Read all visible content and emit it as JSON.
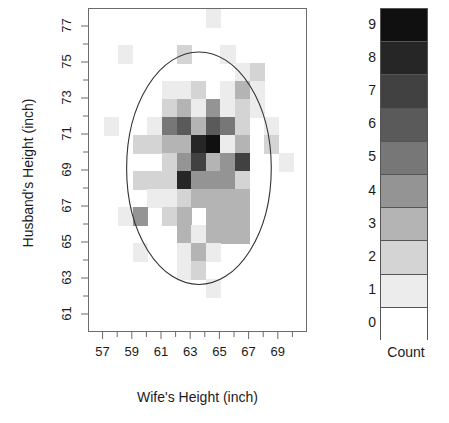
{
  "chart_data": {
    "type": "heatmap",
    "title": "",
    "xlabel": "Wife's Height (inch)",
    "ylabel": "Husband's Height (inch)",
    "xlim": [
      56,
      71
    ],
    "ylim": [
      60,
      78
    ],
    "grid": false,
    "legend_position": "right",
    "legend_title": "Count",
    "legend_ticks": [
      "9",
      "8",
      "7",
      "6",
      "5",
      "4",
      "3",
      "2",
      "1",
      "0"
    ],
    "colorscale": {
      "0": "#ffffff",
      "1": "#ececec",
      "2": "#d4d4d4",
      "3": "#b4b4b4",
      "4": "#949494",
      "5": "#777777",
      "6": "#5a5a5a",
      "7": "#414141",
      "8": "#262626",
      "9": "#101010"
    },
    "xtick_labels": [
      "57",
      "59",
      "61",
      "63",
      "65",
      "67",
      "69"
    ],
    "xtick_values": [
      57,
      59,
      61,
      63,
      65,
      67,
      69
    ],
    "ytick_labels": [
      "61",
      "63",
      "65",
      "67",
      "69",
      "71",
      "73",
      "75",
      "77"
    ],
    "ytick_values": [
      61,
      63,
      65,
      67,
      69,
      71,
      73,
      75,
      77
    ],
    "x_minor_step": 1,
    "y_minor_step": 1,
    "cell_width_inch": 1,
    "cell_height_inch": 1,
    "ellipse": {
      "center_x": 63.6,
      "center_y": 69.1,
      "radius_x": 5.0,
      "radius_y": 6.5,
      "stroke": "#333333"
    },
    "cells": [
      {
        "x": 64,
        "y": 77,
        "count": 1
      },
      {
        "x": 58,
        "y": 75,
        "count": 1
      },
      {
        "x": 62,
        "y": 75,
        "count": 2
      },
      {
        "x": 65,
        "y": 75,
        "count": 1
      },
      {
        "x": 66,
        "y": 74,
        "count": 1
      },
      {
        "x": 67,
        "y": 74,
        "count": 2
      },
      {
        "x": 61,
        "y": 73,
        "count": 1
      },
      {
        "x": 62,
        "y": 73,
        "count": 1
      },
      {
        "x": 63,
        "y": 73,
        "count": 2
      },
      {
        "x": 65,
        "y": 73,
        "count": 1
      },
      {
        "x": 66,
        "y": 73,
        "count": 3
      },
      {
        "x": 67,
        "y": 73,
        "count": 1
      },
      {
        "x": 61,
        "y": 72,
        "count": 2
      },
      {
        "x": 62,
        "y": 72,
        "count": 3
      },
      {
        "x": 63,
        "y": 72,
        "count": 1
      },
      {
        "x": 64,
        "y": 72,
        "count": 4
      },
      {
        "x": 65,
        "y": 72,
        "count": 1
      },
      {
        "x": 66,
        "y": 72,
        "count": 2
      },
      {
        "x": 67,
        "y": 72,
        "count": 1
      },
      {
        "x": 57,
        "y": 71,
        "count": 1
      },
      {
        "x": 60,
        "y": 71,
        "count": 1
      },
      {
        "x": 61,
        "y": 71,
        "count": 5
      },
      {
        "x": 62,
        "y": 71,
        "count": 6
      },
      {
        "x": 63,
        "y": 71,
        "count": 3
      },
      {
        "x": 64,
        "y": 71,
        "count": 6
      },
      {
        "x": 65,
        "y": 71,
        "count": 5
      },
      {
        "x": 66,
        "y": 71,
        "count": 2
      },
      {
        "x": 68,
        "y": 71,
        "count": 1
      },
      {
        "x": 59,
        "y": 70,
        "count": 2
      },
      {
        "x": 60,
        "y": 70,
        "count": 2
      },
      {
        "x": 61,
        "y": 70,
        "count": 3
      },
      {
        "x": 62,
        "y": 70,
        "count": 3
      },
      {
        "x": 63,
        "y": 70,
        "count": 8
      },
      {
        "x": 64,
        "y": 70,
        "count": 9
      },
      {
        "x": 65,
        "y": 70,
        "count": 1
      },
      {
        "x": 66,
        "y": 70,
        "count": 3
      },
      {
        "x": 68,
        "y": 70,
        "count": 2
      },
      {
        "x": 61,
        "y": 69,
        "count": 2
      },
      {
        "x": 62,
        "y": 69,
        "count": 4
      },
      {
        "x": 63,
        "y": 69,
        "count": 7
      },
      {
        "x": 64,
        "y": 69,
        "count": 3
      },
      {
        "x": 65,
        "y": 69,
        "count": 4
      },
      {
        "x": 66,
        "y": 69,
        "count": 7
      },
      {
        "x": 69,
        "y": 69,
        "count": 1
      },
      {
        "x": 59,
        "y": 68,
        "count": 2
      },
      {
        "x": 60,
        "y": 68,
        "count": 2
      },
      {
        "x": 61,
        "y": 68,
        "count": 2
      },
      {
        "x": 62,
        "y": 68,
        "count": 8
      },
      {
        "x": 63,
        "y": 68,
        "count": 4
      },
      {
        "x": 64,
        "y": 68,
        "count": 4
      },
      {
        "x": 65,
        "y": 68,
        "count": 4
      },
      {
        "x": 66,
        "y": 68,
        "count": 2
      },
      {
        "x": 60,
        "y": 67,
        "count": 1
      },
      {
        "x": 61,
        "y": 67,
        "count": 1
      },
      {
        "x": 62,
        "y": 67,
        "count": 2
      },
      {
        "x": 63,
        "y": 67,
        "count": 3
      },
      {
        "x": 64,
        "y": 67,
        "count": 3
      },
      {
        "x": 65,
        "y": 67,
        "count": 3
      },
      {
        "x": 66,
        "y": 67,
        "count": 3
      },
      {
        "x": 58,
        "y": 66,
        "count": 1
      },
      {
        "x": 59,
        "y": 66,
        "count": 4
      },
      {
        "x": 61,
        "y": 66,
        "count": 2
      },
      {
        "x": 62,
        "y": 66,
        "count": 3
      },
      {
        "x": 63,
        "y": 66,
        "count": 0
      },
      {
        "x": 64,
        "y": 66,
        "count": 3
      },
      {
        "x": 65,
        "y": 66,
        "count": 3
      },
      {
        "x": 66,
        "y": 66,
        "count": 3
      },
      {
        "x": 62,
        "y": 65,
        "count": 3
      },
      {
        "x": 63,
        "y": 65,
        "count": 1
      },
      {
        "x": 64,
        "y": 65,
        "count": 3
      },
      {
        "x": 65,
        "y": 65,
        "count": 3
      },
      {
        "x": 66,
        "y": 65,
        "count": 3
      },
      {
        "x": 59,
        "y": 64,
        "count": 1
      },
      {
        "x": 62,
        "y": 64,
        "count": 1
      },
      {
        "x": 63,
        "y": 64,
        "count": 3
      },
      {
        "x": 64,
        "y": 64,
        "count": 1
      },
      {
        "x": 62,
        "y": 63,
        "count": 1
      },
      {
        "x": 63,
        "y": 63,
        "count": 2
      },
      {
        "x": 64,
        "y": 62,
        "count": 1
      }
    ]
  }
}
